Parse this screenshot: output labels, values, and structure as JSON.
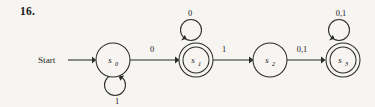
{
  "figure": {
    "exercise_number": "16.",
    "start_label": "Start",
    "caption": ""
  },
  "states": [
    {
      "id": "s0",
      "name": "s",
      "subscript": "0",
      "accepting": false,
      "cx": 113,
      "cy": 60,
      "r": 17
    },
    {
      "id": "s1",
      "name": "s",
      "subscript": "1",
      "accepting": true,
      "cx": 196,
      "cy": 60,
      "r": 17
    },
    {
      "id": "s2",
      "name": "s",
      "subscript": "2",
      "accepting": false,
      "cx": 270,
      "cy": 60,
      "r": 17
    },
    {
      "id": "s3",
      "name": "s",
      "subscript": "3",
      "accepting": true,
      "cx": 343,
      "cy": 60,
      "r": 17
    }
  ],
  "transitions": [
    {
      "id": "t0",
      "from": "s0",
      "to": "s1",
      "label": "0",
      "label_x": 152,
      "label_y": 52
    },
    {
      "id": "t1",
      "from": "s1",
      "to": "s2",
      "label": "1",
      "label_x": 224,
      "label_y": 52
    },
    {
      "id": "t2",
      "from": "s2",
      "to": "s3",
      "label": "0,1",
      "label_x": 302,
      "label_y": 52
    },
    {
      "id": "t3",
      "from": "s0",
      "to": "s0",
      "label": "1",
      "loop": "below",
      "label_x": 117,
      "label_y": 104
    },
    {
      "id": "t4",
      "from": "s1",
      "to": "s1",
      "label": "0",
      "loop": "above",
      "label_x": 190,
      "label_y": 16
    },
    {
      "id": "t5",
      "from": "s3",
      "to": "s3",
      "label": "0,1",
      "loop": "above",
      "label_x": 341,
      "label_y": 16
    }
  ],
  "colors": {
    "background": "#f7f5f2",
    "ink": "#2a2a2c",
    "text": "#19191b"
  }
}
